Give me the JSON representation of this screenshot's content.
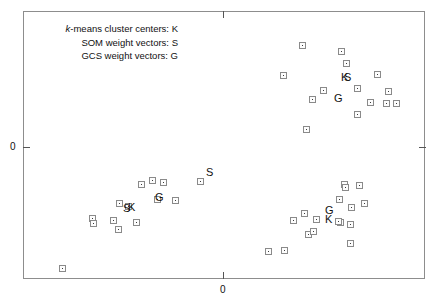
{
  "chart_data": {
    "type": "scatter",
    "title": "",
    "xlabel": "",
    "ylabel": "",
    "grid": false,
    "legend_position": "top-left",
    "axis": {
      "x_tick_labels": [
        "0"
      ],
      "y_tick_labels": [
        "0"
      ],
      "x_tick_positions_px": [
        223
      ],
      "y_tick_positions_px": [
        147
      ],
      "frame_px": {
        "left": 23,
        "top": 11,
        "right": 425,
        "bottom": 279
      }
    },
    "legend": [
      {
        "prefix_italic": "k",
        "text": "-means cluster centers: K",
        "symbol": "K"
      },
      {
        "prefix_italic": "",
        "text": "SOM weight vectors: S",
        "symbol": "S"
      },
      {
        "prefix_italic": "",
        "text": "GCS weight vectors: G",
        "symbol": "G"
      }
    ],
    "series": [
      {
        "name": "data-points",
        "marker": "open-square-with-dot",
        "points_px": [
          [
            302,
            45
          ],
          [
            341,
            51
          ],
          [
            346,
            63
          ],
          [
            283,
            75
          ],
          [
            323,
            90
          ],
          [
            312,
            99
          ],
          [
            377,
            74
          ],
          [
            357,
            88
          ],
          [
            388,
            91
          ],
          [
            370,
            102
          ],
          [
            386,
            103
          ],
          [
            396,
            103
          ],
          [
            357,
            114
          ],
          [
            306,
            129
          ],
          [
            141,
            184
          ],
          [
            152,
            180
          ],
          [
            163,
            182
          ],
          [
            200,
            181
          ],
          [
            157,
            199
          ],
          [
            175,
            200
          ],
          [
            119,
            203
          ],
          [
            128,
            206
          ],
          [
            92,
            218
          ],
          [
            93,
            223
          ],
          [
            113,
            220
          ],
          [
            136,
            222
          ],
          [
            118,
            229
          ],
          [
            62,
            268
          ],
          [
            344,
            184
          ],
          [
            345,
            187
          ],
          [
            359,
            185
          ],
          [
            339,
            199
          ],
          [
            364,
            203
          ],
          [
            351,
            207
          ],
          [
            340,
            222
          ],
          [
            350,
            224
          ],
          [
            293,
            220
          ],
          [
            304,
            213
          ],
          [
            316,
            219
          ],
          [
            338,
            221
          ],
          [
            308,
            234
          ],
          [
            313,
            231
          ],
          [
            268,
            251
          ],
          [
            284,
            250
          ],
          [
            350,
            243
          ]
        ]
      }
    ],
    "annotations": [
      {
        "label": "K",
        "x_px": 341,
        "y_px": 72
      },
      {
        "label": "S",
        "x_px": 344,
        "y_px": 72
      },
      {
        "label": "G",
        "x_px": 334,
        "y_px": 93
      },
      {
        "label": "S",
        "x_px": 206,
        "y_px": 167
      },
      {
        "label": "G",
        "x_px": 155,
        "y_px": 192
      },
      {
        "label": "S",
        "x_px": 123,
        "y_px": 203
      },
      {
        "label": "K",
        "x_px": 128,
        "y_px": 202
      },
      {
        "label": "G",
        "x_px": 325,
        "y_px": 205
      },
      {
        "label": "K",
        "x_px": 325,
        "y_px": 214
      }
    ]
  }
}
